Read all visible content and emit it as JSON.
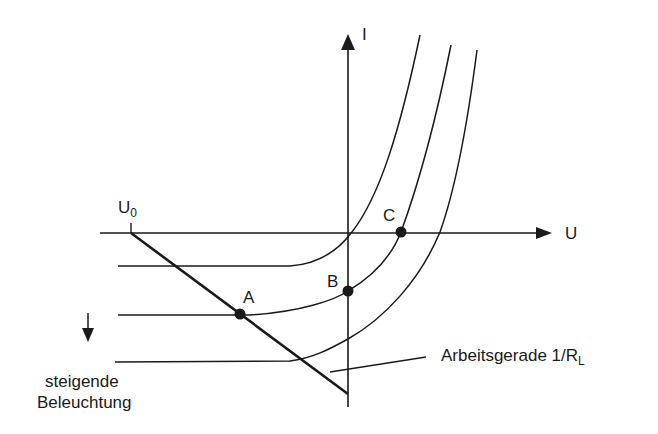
{
  "diagram": {
    "title": "",
    "axes": {
      "x_label": "U",
      "y_label": "I"
    },
    "open_circuit_label": {
      "main": "U",
      "sub": "0"
    },
    "points": [
      {
        "label": "A"
      },
      {
        "label": "B"
      },
      {
        "label": "C"
      }
    ],
    "load_line_label": {
      "text": "Arbeitsgerade 1/R",
      "sub": "L"
    },
    "illumination_label": {
      "line1": "steigende",
      "line2": "Beleuchtung"
    },
    "colors": {
      "stroke": "#1a1a1a",
      "background": "#ffffff"
    }
  }
}
